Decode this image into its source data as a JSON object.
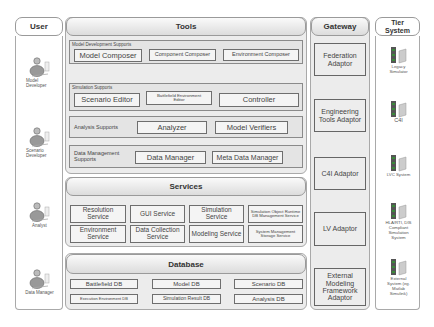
{
  "columns": {
    "user": {
      "title": "User"
    },
    "tools": {
      "title": "Tools"
    },
    "gateway": {
      "title": "Gateway"
    },
    "tier": {
      "title": "Tier System"
    }
  },
  "users": [
    {
      "label": "Model Developer"
    },
    {
      "label": "Scenario Developer"
    },
    {
      "label": "Analyst"
    },
    {
      "label": "Data Manager"
    }
  ],
  "tools": {
    "groups": [
      {
        "label": "Model Development  Supports",
        "items": [
          "Model Composer",
          "Component Composer",
          "Environment Composer"
        ]
      },
      {
        "label": "Simulation Supports",
        "items": [
          "Scenario Editor",
          "Battlefield Environment Editor",
          "Controller"
        ]
      },
      {
        "label": "Analysis Supports",
        "items": [
          "Analyzer",
          "Model Verifiers"
        ]
      },
      {
        "label": "Data Management Supports",
        "items": [
          "Data Manager",
          "Meta Data Manager"
        ]
      }
    ]
  },
  "services": {
    "title": "Services",
    "items": [
      "Resolution Service",
      "GUI Service",
      "Simulation Service",
      "Simulation Object Runtime DB Management Service",
      "Environment Service",
      "Data Collection Service",
      "Modeling Service",
      "System Management Storage Service"
    ]
  },
  "database": {
    "title": "Database",
    "items": [
      "Battlefield DB",
      "Model DB",
      "Scenario DB",
      "Execution Environment DB",
      "Simulation Result DB",
      "Analysis DB"
    ]
  },
  "gateway": {
    "items": [
      "Federation Adaptor",
      "Engineering Tools Adaptor",
      "C4I  Adaptor",
      "LV Adaptor",
      "External Modeling Framework Adaptor"
    ]
  },
  "tier_systems": [
    {
      "label": "Legacy Simulator"
    },
    {
      "label": "C4I"
    },
    {
      "label": "LVC System"
    },
    {
      "label": "HLA/RTI, DIS Compliant Simulation System"
    },
    {
      "label": "External System (eg. Matlab Simulink)"
    }
  ],
  "colors": {
    "panel_bg": "#ececec",
    "group_bg": "#e4e4e4",
    "box_bg": "#f4f4f4",
    "border": "#8a8a8a"
  }
}
